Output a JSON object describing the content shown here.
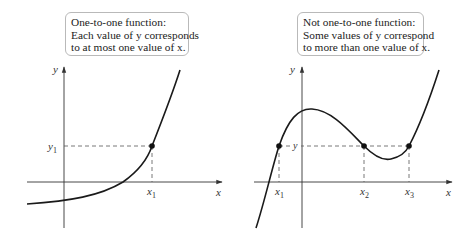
{
  "panels": [
    {
      "id": "one-to-one",
      "callout": {
        "lines": [
          "One-to-one function:",
          "Each value of y corresponds",
          "to at most one value of x."
        ]
      },
      "axis_labels": {
        "x": "x",
        "y": "y"
      },
      "point_labels": {
        "x": [
          "x",
          "1"
        ],
        "y": [
          "y",
          "1"
        ]
      }
    },
    {
      "id": "not-one-to-one",
      "callout": {
        "lines": [
          "Not one-to-one function:",
          "Some values of y correspond",
          "to more than one value of x."
        ]
      },
      "axis_labels": {
        "x": "x",
        "y": "y"
      },
      "y_level_label": "y",
      "point_labels": {
        "x": [
          [
            "x",
            "1"
          ],
          [
            "x",
            "2"
          ],
          [
            "x",
            "3"
          ]
        ]
      }
    }
  ],
  "colors": {
    "curve": "#1a1a1a",
    "axis": "#333333",
    "dashed": "#555555",
    "callout_border": "#b9b9b9"
  }
}
